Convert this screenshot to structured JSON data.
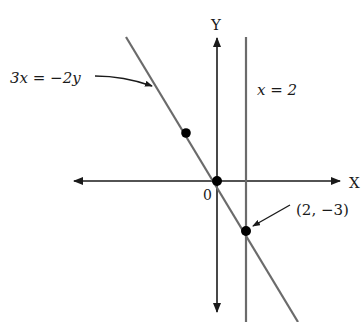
{
  "diagram": {
    "type": "coordinate-plane-graph",
    "axes": {
      "x_label": "X",
      "y_label": "Y",
      "origin_label": "0"
    },
    "lines": [
      {
        "equation_label": "3x = −2y",
        "kind": "diagonal",
        "color": "#6b6b6b"
      },
      {
        "equation_label": "x = 2",
        "kind": "vertical",
        "color": "#6b6b6b"
      }
    ],
    "points": [
      {
        "label": "(2, −3)",
        "x": 2,
        "y": -3
      },
      {
        "label": "",
        "x": 0,
        "y": 0
      },
      {
        "label": "",
        "x": -2,
        "y": 3
      }
    ],
    "colors": {
      "axis": "#1a1a1a",
      "line": "#6b6b6b",
      "point": "#000000",
      "background": "#ffffff"
    }
  }
}
